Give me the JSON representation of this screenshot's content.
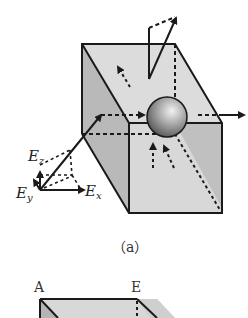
{
  "figure_a": {
    "caption": "（a）",
    "labels": {
      "ez_main": "E",
      "ez_sub": "z",
      "ey_main": "E",
      "ey_sub": "y",
      "ex_main": "E",
      "ex_sub": "x"
    },
    "colors": {
      "top_face": "#dcdcdc",
      "left_face": "#b8b8b8",
      "front_face": "#d6d6d6",
      "right_face": "#bdbdbd",
      "edge": "#1a1a1a",
      "sphere_light": "#e6e6e6",
      "sphere_dark": "#5a5a5a"
    }
  },
  "figure_b": {
    "labels": {
      "vertex_a": "A",
      "vertex_e": "E"
    }
  }
}
